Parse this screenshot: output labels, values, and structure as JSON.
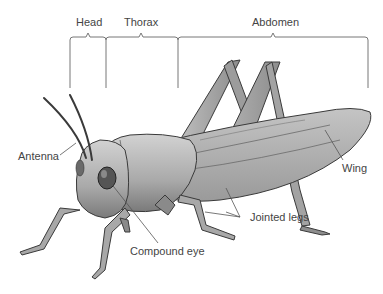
{
  "diagram": {
    "segments": [
      {
        "label": "Head",
        "x1": 70,
        "x2": 106
      },
      {
        "label": "Thorax",
        "x1": 106,
        "x2": 178
      },
      {
        "label": "Abdomen",
        "x1": 178,
        "x2": 368
      }
    ],
    "labels": {
      "antenna": "Antenna",
      "compound_eye": "Compound eye",
      "jointed_legs": "Jointed legs",
      "wing": "Wing"
    },
    "colors": {
      "label_text": "#444444",
      "leader_line": "#555555",
      "body_light": "#c9c9c9",
      "body_mid": "#a8a8a8",
      "body_dark": "#6a6a6a",
      "outline": "#3a3a3a"
    }
  }
}
